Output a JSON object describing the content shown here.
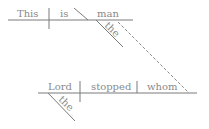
{
  "diagram": {
    "type": "sentence-diagram",
    "main_clause": {
      "subject": "This",
      "verb": "is",
      "predicate_nominative": "man",
      "modifiers": [
        {
          "word": "the",
          "modifies": "man"
        }
      ]
    },
    "relative_clause": {
      "subject": "Lord",
      "verb": "stopped",
      "object": "whom",
      "modifiers": [
        {
          "word": "the",
          "modifies": "Lord"
        }
      ],
      "connects_to": "man"
    },
    "colors": {
      "line": "#7a7a7a",
      "text": "#8a8a8a"
    }
  }
}
